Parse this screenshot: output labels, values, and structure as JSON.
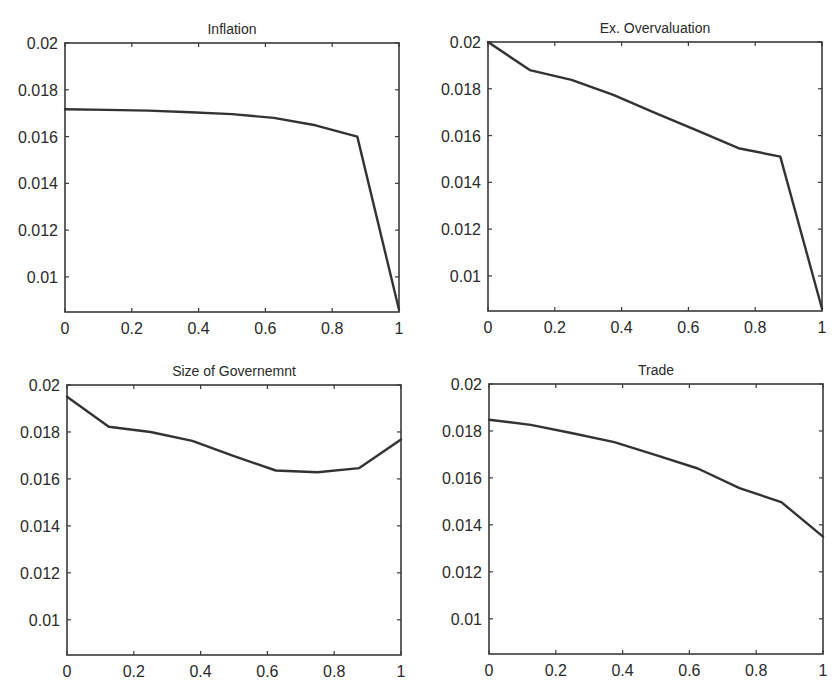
{
  "chart_data": [
    {
      "type": "line",
      "title": "Inflation",
      "xlabel": "",
      "ylabel": "",
      "xlim": [
        0,
        1
      ],
      "ylim": [
        0.0085,
        0.02
      ],
      "grid": false,
      "legend": null,
      "xticks": [
        0,
        0.2,
        0.4,
        0.6,
        0.8,
        1
      ],
      "xtick_labels": [
        "0",
        "0.2",
        "0.4",
        "0.6",
        "0.8",
        "1"
      ],
      "yticks": [
        0.01,
        0.012,
        0.014,
        0.016,
        0.018,
        0.02
      ],
      "ytick_labels": [
        "0.01",
        "0.012",
        "0.014",
        "0.016",
        "0.018",
        "0.02"
      ],
      "x": [
        0,
        0.125,
        0.25,
        0.375,
        0.5,
        0.625,
        0.75,
        0.875,
        1
      ],
      "values": [
        0.01717,
        0.01714,
        0.01711,
        0.01704,
        0.01696,
        0.0168,
        0.01648,
        0.016,
        0.0086
      ],
      "box": {
        "left": 65,
        "top": 43,
        "right": 399,
        "bottom": 312
      }
    },
    {
      "type": "line",
      "title": "Ex. Overvaluation",
      "xlabel": "",
      "ylabel": "",
      "xlim": [
        0,
        1
      ],
      "ylim": [
        0.0085,
        0.02
      ],
      "grid": false,
      "legend": null,
      "xticks": [
        0,
        0.2,
        0.4,
        0.6,
        0.8,
        1
      ],
      "xtick_labels": [
        "0",
        "0.2",
        "0.4",
        "0.6",
        "0.8",
        "1"
      ],
      "yticks": [
        0.01,
        0.012,
        0.014,
        0.016,
        0.018,
        0.02
      ],
      "ytick_labels": [
        "0.01",
        "0.012",
        "0.014",
        "0.016",
        "0.018",
        "0.02"
      ],
      "x": [
        0,
        0.125,
        0.25,
        0.375,
        0.5,
        0.625,
        0.75,
        0.875,
        1
      ],
      "values": [
        0.02,
        0.0188,
        0.01838,
        0.01774,
        0.01697,
        0.01622,
        0.01546,
        0.0151,
        0.0086
      ],
      "box": {
        "left": 488,
        "top": 42,
        "right": 822,
        "bottom": 311
      }
    },
    {
      "type": "line",
      "title": "Size of Governemnt",
      "xlabel": "",
      "ylabel": "",
      "xlim": [
        0,
        1
      ],
      "ylim": [
        0.0085,
        0.02
      ],
      "grid": false,
      "legend": null,
      "xticks": [
        0,
        0.2,
        0.4,
        0.6,
        0.8,
        1
      ],
      "xtick_labels": [
        "0",
        "0.2",
        "0.4",
        "0.6",
        "0.8",
        "1"
      ],
      "yticks": [
        0.01,
        0.012,
        0.014,
        0.016,
        0.018,
        0.02
      ],
      "ytick_labels": [
        "0.01",
        "0.012",
        "0.014",
        "0.016",
        "0.018",
        "0.02"
      ],
      "x": [
        0,
        0.125,
        0.25,
        0.375,
        0.5,
        0.625,
        0.75,
        0.875,
        1
      ],
      "values": [
        0.0195,
        0.01822,
        0.018,
        0.01762,
        0.01697,
        0.01636,
        0.01628,
        0.01646,
        0.01768
      ],
      "box": {
        "left": 67,
        "top": 385,
        "right": 401,
        "bottom": 655
      }
    },
    {
      "type": "line",
      "title": "Trade",
      "xlabel": "",
      "ylabel": "",
      "xlim": [
        0,
        1
      ],
      "ylim": [
        0.0085,
        0.02
      ],
      "grid": false,
      "legend": null,
      "xticks": [
        0,
        0.2,
        0.4,
        0.6,
        0.8,
        1
      ],
      "xtick_labels": [
        "0",
        "0.2",
        "0.4",
        "0.6",
        "0.8",
        "1"
      ],
      "yticks": [
        0.01,
        0.012,
        0.014,
        0.016,
        0.018,
        0.02
      ],
      "ytick_labels": [
        "0.01",
        "0.012",
        "0.014",
        "0.016",
        "0.018",
        "0.02"
      ],
      "x": [
        0,
        0.125,
        0.25,
        0.375,
        0.5,
        0.625,
        0.75,
        0.875,
        1
      ],
      "values": [
        0.01848,
        0.01826,
        0.0179,
        0.01752,
        0.01697,
        0.0164,
        0.01556,
        0.01497,
        0.0135
      ],
      "box": {
        "left": 489,
        "top": 384,
        "right": 823,
        "bottom": 654
      }
    }
  ],
  "style": {
    "line_color": "#333333",
    "axes_color": "#3a3a3a",
    "text_color": "#2a2a2a",
    "background": "#ffffff"
  }
}
